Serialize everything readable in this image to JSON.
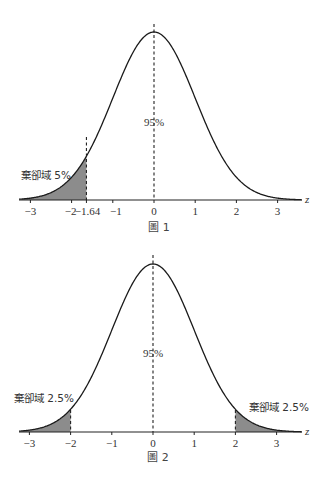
{
  "chart_data": [
    {
      "type": "area",
      "title": "圖 1",
      "description": "Standard normal curve with one-tailed (left) rejection region",
      "xlabel": "z",
      "ylabel": "",
      "xlim": [
        -3.2,
        3.6
      ],
      "x_ticks": [
        -3,
        -2,
        -1.64,
        -1,
        0,
        1,
        2,
        3
      ],
      "x_tick_labels": [
        "−3",
        "−2",
        "−1.64",
        "−1",
        "0",
        "1",
        "2",
        "3"
      ],
      "dashed_lines_at": [
        -1.64,
        0
      ],
      "shaded_regions": [
        {
          "from": -3.2,
          "to": -1.64,
          "label": "棄卻域 5%"
        }
      ],
      "center_label": "95%",
      "grid": false
    },
    {
      "type": "area",
      "title": "圖 2",
      "description": "Standard normal curve with two-tailed rejection regions",
      "xlabel": "z",
      "ylabel": "",
      "xlim": [
        -3.2,
        3.6
      ],
      "x_ticks": [
        -3,
        -2,
        -1,
        0,
        1,
        2,
        3
      ],
      "x_tick_labels": [
        "−3",
        "−2",
        "−1",
        "0",
        "1",
        "2",
        "3"
      ],
      "dashed_lines_at": [
        -2,
        0,
        2
      ],
      "shaded_regions": [
        {
          "from": -3.2,
          "to": -2,
          "label": "棄卻域 2.5%"
        },
        {
          "from": 2,
          "to": 3.6,
          "label": "棄卻域 2.5%"
        }
      ],
      "center_label": "95%",
      "grid": false
    }
  ],
  "figure1": {
    "caption": "圖 1",
    "axis_label": "z",
    "center_label": "95%",
    "rejection_label": "棄卻域 5%",
    "ticks": [
      {
        "value": -3,
        "label": "−3"
      },
      {
        "value": -2,
        "label": "−2"
      },
      {
        "value": -1.64,
        "label": "−1.64"
      },
      {
        "value": -1,
        "label": "−1"
      },
      {
        "value": 0,
        "label": "0"
      },
      {
        "value": 1,
        "label": "1"
      },
      {
        "value": 2,
        "label": "2"
      },
      {
        "value": 3,
        "label": "3"
      }
    ],
    "critical_value": -1.64
  },
  "figure2": {
    "caption": "圖 2",
    "axis_label": "z",
    "center_label": "95%",
    "rejection_label_left": "棄卻域 2.5%",
    "rejection_label_right": "棄卻域 2.5%",
    "ticks": [
      {
        "value": -3,
        "label": "−3"
      },
      {
        "value": -2,
        "label": "−2"
      },
      {
        "value": -1,
        "label": "−1"
      },
      {
        "value": 0,
        "label": "0"
      },
      {
        "value": 1,
        "label": "1"
      },
      {
        "value": 2,
        "label": "2"
      },
      {
        "value": 3,
        "label": "3"
      }
    ],
    "critical_values": [
      -2,
      2
    ]
  },
  "colors": {
    "curve": "#1a1a1a",
    "shade": "#8c8c8c",
    "axis": "#222222",
    "text": "#333333"
  }
}
